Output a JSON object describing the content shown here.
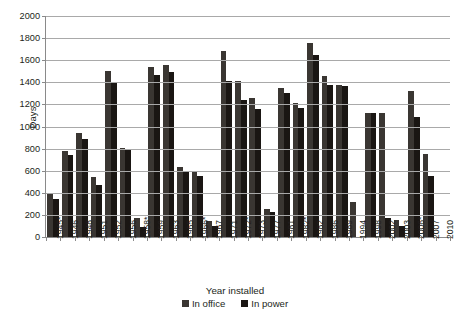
{
  "chart_data": {
    "type": "bar",
    "title": "",
    "xlabel": "Year installed",
    "ylabel": "Days",
    "ylim": [
      0,
      2000
    ],
    "ytick_step": 200,
    "yticks": [
      0,
      200,
      400,
      600,
      800,
      1000,
      1200,
      1400,
      1600,
      1800,
      2000
    ],
    "grid": true,
    "legend_position": "bottom",
    "categories": [
      "1945*",
      "1946",
      "1948",
      "1951",
      "1952",
      "1956",
      "1958*",
      "1959",
      "1963",
      "1965",
      "1966*",
      "1967",
      "1971",
      "1972*",
      "1973",
      "1977",
      "1981",
      "1982*",
      "1982",
      "1986",
      "1989",
      "1994",
      "1998",
      "2002",
      "2003",
      "2006*",
      "2007",
      "2010"
    ],
    "series": [
      {
        "name": "In office",
        "color": "#3a3632",
        "values": [
          390,
          780,
          945,
          540,
          1505,
          810,
          170,
          1540,
          1555,
          635,
          600,
          145,
          1680,
          1415,
          1255,
          250,
          1350,
          1215,
          1755,
          1455,
          1375,
          315,
          1120,
          1120,
          155,
          1320,
          755,
          0
        ]
      },
      {
        "name": "In power",
        "color": "#1a1613",
        "values": [
          340,
          745,
          890,
          475,
          1390,
          795,
          95,
          1465,
          1490,
          590,
          550,
          100,
          1410,
          1240,
          1155,
          230,
          1300,
          1170,
          1645,
          1375,
          1370,
          0,
          1120,
          170,
          100,
          1085,
          555,
          0
        ]
      }
    ]
  },
  "axis": {
    "y_title": "Days",
    "x_title": "Year installed"
  },
  "legend": {
    "entries": [
      {
        "label": "In office",
        "color": "#3a3632",
        "icon": "square-swatch-icon"
      },
      {
        "label": "In power",
        "color": "#1a1613",
        "icon": "square-swatch-icon"
      }
    ]
  }
}
